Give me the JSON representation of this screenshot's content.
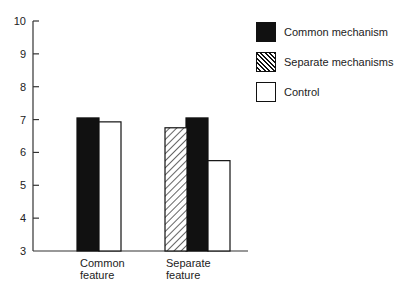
{
  "chart_data": {
    "type": "bar",
    "title": "",
    "xlabel": "",
    "ylabel": "",
    "ylim": [
      3,
      10
    ],
    "yticks": [
      3,
      4,
      5,
      6,
      7,
      8,
      9,
      10
    ],
    "grid": false,
    "legend_position": "top-right",
    "categories": [
      "Common feature",
      "Separate feature"
    ],
    "category_lines": [
      [
        "Common",
        "feature"
      ],
      [
        "Separate",
        "feature"
      ]
    ],
    "series": [
      {
        "name": "Common mechanism",
        "fill": "solid-black",
        "values": [
          7.05,
          7.05
        ]
      },
      {
        "name": "Separate mechanisms",
        "fill": "diagonal-hatch",
        "values": [
          null,
          6.75
        ]
      },
      {
        "name": "Control",
        "fill": "white",
        "values": [
          6.93,
          5.75
        ]
      }
    ]
  },
  "legend": {
    "items": [
      {
        "label": "Common mechanism",
        "fill": "solid-black"
      },
      {
        "label": "Separate mechanisms",
        "fill": "diagonal-hatch"
      },
      {
        "label": "Control",
        "fill": "white"
      }
    ]
  },
  "colors": {
    "ink": "#111111",
    "background": "#ffffff"
  }
}
